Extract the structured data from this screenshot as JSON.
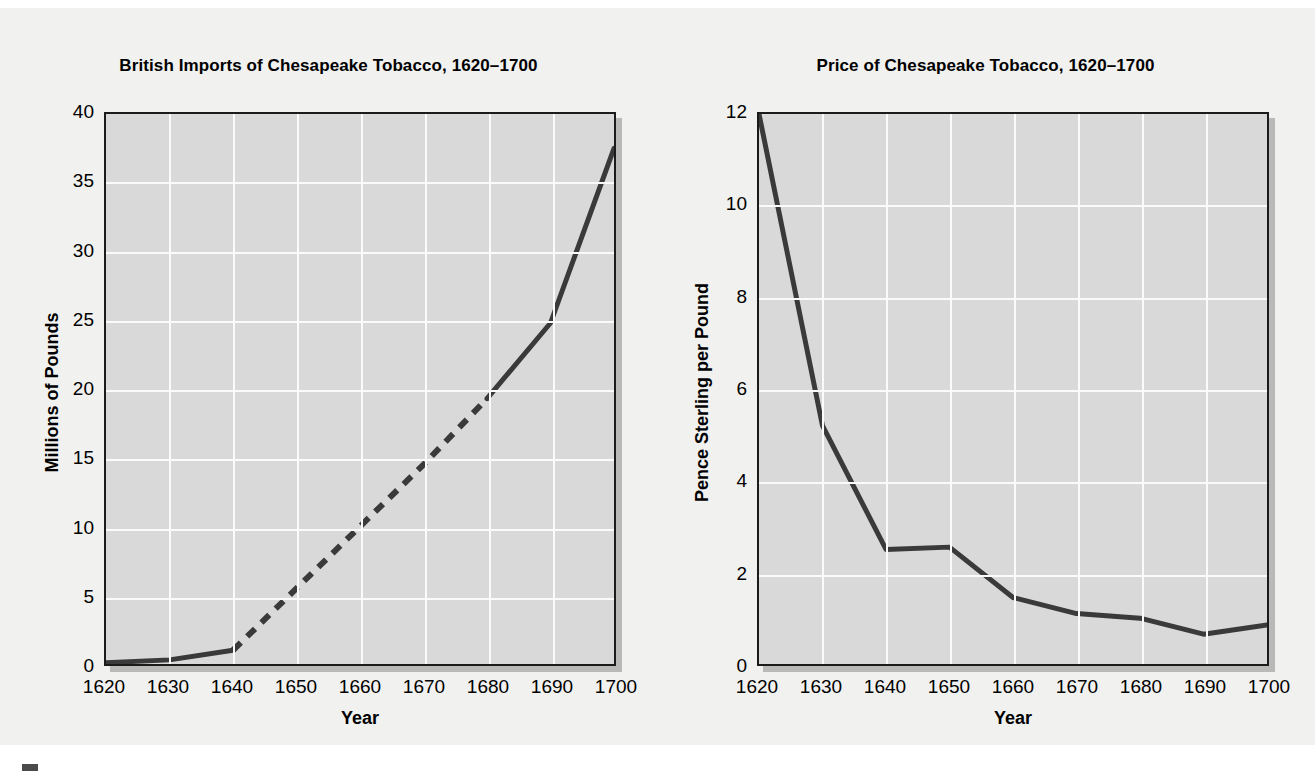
{
  "figure": {
    "background_color": "#f1f1ef",
    "plot_background_color": "#d9d9d9",
    "gridline_color": "#fbfbfb",
    "line_color": "#3a3a3a",
    "axis_color": "#1b1b1b"
  },
  "charts": [
    {
      "id": "british-imports",
      "title": "British Imports of Chesapeake Tobacco, 1620–1700",
      "xlabel": "Year",
      "ylabel": "Millions of Pounds",
      "yticks": [
        "40",
        "35",
        "30",
        "25",
        "20",
        "15",
        "10",
        "5",
        "0"
      ],
      "xticks": [
        "1620",
        "1630",
        "1640",
        "1650",
        "1660",
        "1670",
        "1680",
        "1690",
        "1700"
      ]
    },
    {
      "id": "price",
      "title": "Price of Chesapeake Tobacco, 1620–1700",
      "xlabel": "Year",
      "ylabel": "Pence Sterling per Pound",
      "yticks": [
        "12",
        "10",
        "8",
        "6",
        "4",
        "2",
        "0"
      ],
      "xticks": [
        "1620",
        "1630",
        "1640",
        "1650",
        "1660",
        "1670",
        "1680",
        "1690",
        "1700"
      ]
    }
  ],
  "chart_data": [
    {
      "type": "line",
      "title": "British Imports of Chesapeake Tobacco, 1620–1700",
      "xlabel": "Year",
      "ylabel": "Millions of Pounds",
      "x": [
        1620,
        1630,
        1640,
        1650,
        1660,
        1670,
        1680,
        1690,
        1700
      ],
      "values": [
        0.1,
        0.3,
        1.0,
        5.5,
        10.0,
        14.5,
        19.3,
        24.8,
        37.5
      ],
      "xlim": [
        1620,
        1700
      ],
      "ylim": [
        0,
        40
      ],
      "ytick_values": [
        0,
        5,
        10,
        15,
        20,
        25,
        30,
        35,
        40
      ],
      "xtick_values": [
        1620,
        1630,
        1640,
        1650,
        1660,
        1670,
        1680,
        1690,
        1700
      ],
      "grid": true,
      "legend": "none",
      "segments": [
        {
          "style": "solid",
          "from_x": 1620,
          "to_x": 1640,
          "note": "observed"
        },
        {
          "style": "dashed",
          "from_x": 1640,
          "to_x": 1680,
          "note": "estimated / interpolated"
        },
        {
          "style": "solid",
          "from_x": 1680,
          "to_x": 1700,
          "note": "observed"
        }
      ]
    },
    {
      "type": "line",
      "title": "Price of Chesapeake Tobacco, 1620–1700",
      "xlabel": "Year",
      "ylabel": "Pence Sterling per Pound",
      "x": [
        1620,
        1630,
        1640,
        1650,
        1660,
        1670,
        1680,
        1690,
        1700
      ],
      "values": [
        12.0,
        5.2,
        2.5,
        2.55,
        1.45,
        1.1,
        1.0,
        0.65,
        0.85
      ],
      "xlim": [
        1620,
        1700
      ],
      "ylim": [
        0,
        12
      ],
      "ytick_values": [
        0,
        2,
        4,
        6,
        8,
        10,
        12
      ],
      "xtick_values": [
        1620,
        1630,
        1640,
        1650,
        1660,
        1670,
        1680,
        1690,
        1700
      ],
      "grid": true,
      "legend": "none",
      "segments": [
        {
          "style": "solid",
          "from_x": 1620,
          "to_x": 1700,
          "note": "observed"
        }
      ]
    }
  ]
}
